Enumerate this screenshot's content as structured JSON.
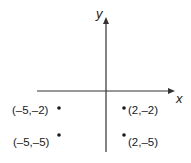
{
  "diagram": {
    "type": "coordinate-plane",
    "axes": {
      "x_label": "x",
      "y_label": "y"
    },
    "points": [
      {
        "label": "(–5,–2)",
        "x": -5,
        "y": -2
      },
      {
        "label": "(2,–2)",
        "x": 2,
        "y": -2
      },
      {
        "label": "(–5,–5)",
        "x": -5,
        "y": -5
      },
      {
        "label": "(2,–5)",
        "x": 2,
        "y": -5
      }
    ],
    "colors": {
      "axis": "#333333",
      "point": "#1a1a1a",
      "background": "#ffffff"
    }
  }
}
